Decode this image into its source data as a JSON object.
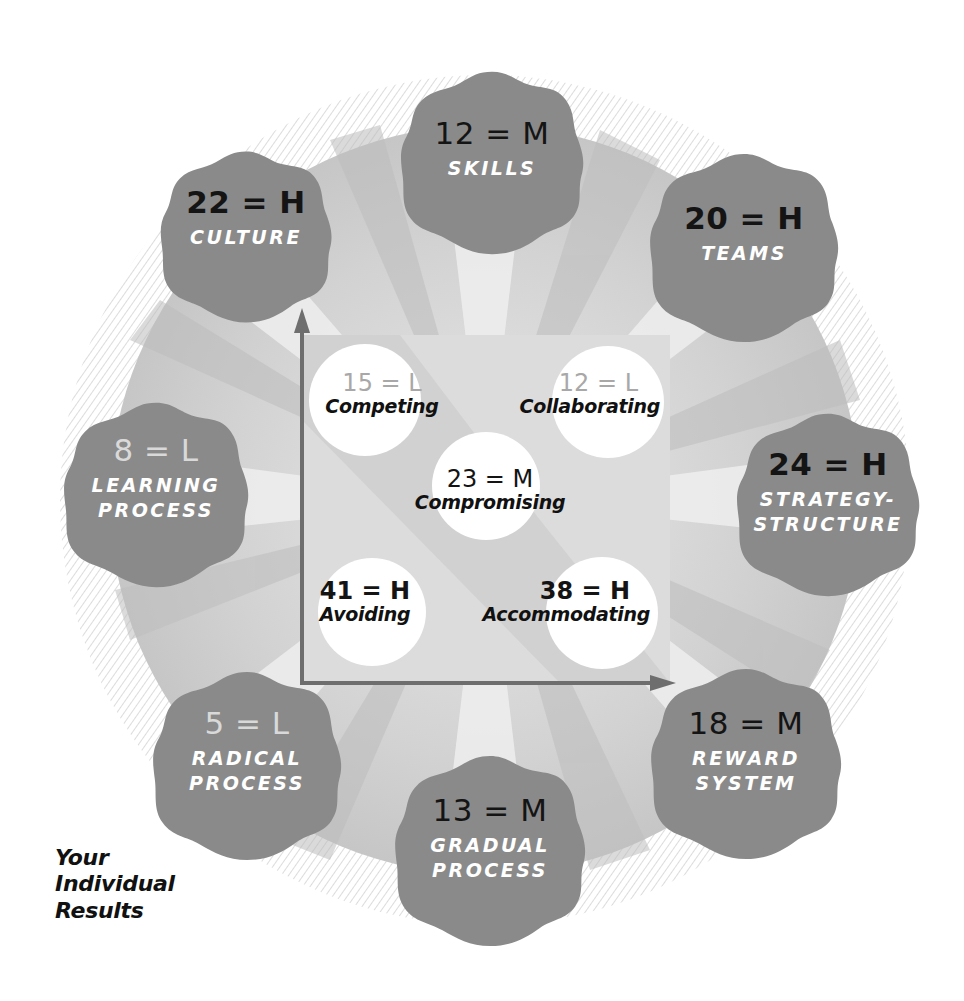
{
  "colors": {
    "badge_fill": "#8a8a8a",
    "rosette_fill": "#cfcfcf",
    "petal_light": "#e6e6e6",
    "center_square": "#dcdcdc",
    "mode_circle": "#ffffff",
    "arrow": "#6e6e6e",
    "label_white": "#ffffff",
    "score_dark": "#141414",
    "score_low": "#d9d9d9"
  },
  "badges": [
    {
      "id": "skills",
      "score": "12 = M",
      "label_lines": [
        "SKILLS"
      ],
      "level": "M"
    },
    {
      "id": "teams",
      "score": "20 = H",
      "label_lines": [
        "TEAMS"
      ],
      "level": "H"
    },
    {
      "id": "strategy-structure",
      "score": "24 = H",
      "label_lines": [
        "STRATEGY-",
        "STRUCTURE"
      ],
      "level": "H"
    },
    {
      "id": "reward-system",
      "score": "18 = M",
      "label_lines": [
        "REWARD",
        "SYSTEM"
      ],
      "level": "M"
    },
    {
      "id": "gradual-process",
      "score": "13 = M",
      "label_lines": [
        "GRADUAL",
        "PROCESS"
      ],
      "level": "M"
    },
    {
      "id": "radical-process",
      "score": "5 = L",
      "label_lines": [
        "RADICAL",
        "PROCESS"
      ],
      "level": "L"
    },
    {
      "id": "learning-process",
      "score": "8 = L",
      "label_lines": [
        "LEARNING",
        "PROCESS"
      ],
      "level": "L"
    },
    {
      "id": "culture",
      "score": "22 = H",
      "label_lines": [
        "CULTURE"
      ],
      "level": "H"
    }
  ],
  "conflict_modes": [
    {
      "id": "competing",
      "score": "15 = L",
      "name": "Competing",
      "level": "L"
    },
    {
      "id": "collaborating",
      "score": "12 = L",
      "name": "Collaborating",
      "level": "L"
    },
    {
      "id": "compromising",
      "score": "23 = M",
      "name": "Compromising",
      "level": "M"
    },
    {
      "id": "avoiding",
      "score": "41 = H",
      "name": "Avoiding",
      "level": "H"
    },
    {
      "id": "accommodating",
      "score": "38 = H",
      "name": "Accommodating",
      "level": "H"
    }
  ],
  "caption": {
    "lines": [
      "Your",
      "Individual",
      "Results"
    ]
  }
}
